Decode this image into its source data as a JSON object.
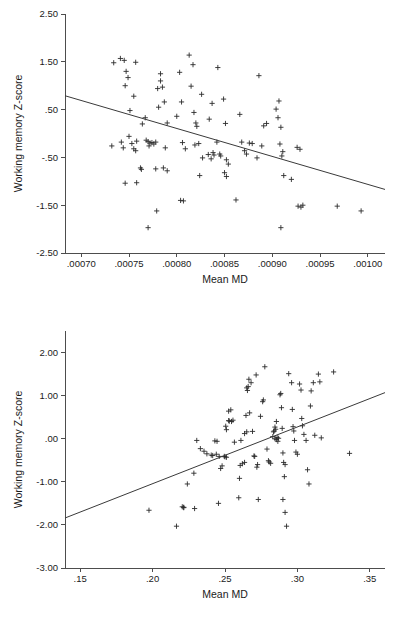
{
  "figure": {
    "title": "",
    "background": "#ffffff",
    "marker_color": "#2b2b2b",
    "axis_color": "#4d4d4d",
    "line_color": "#3a3a3a"
  },
  "chart_data": [
    {
      "id": "top",
      "type": "scatter",
      "title": "",
      "xlabel": "Mean MD",
      "ylabel": "Working memory Z-score",
      "xlim": [
        0.000683,
        0.001018
      ],
      "ylim": [
        -2.5,
        2.5
      ],
      "xticks": [
        0.0007,
        0.00075,
        0.0008,
        0.00085,
        0.0009,
        0.00095,
        0.001
      ],
      "xticklabels": [
        ".00070",
        ".00075",
        ".00080",
        ".00085",
        ".00090",
        ".00095",
        ".00100"
      ],
      "yticks": [
        2.5,
        1.5,
        0.5,
        -0.5,
        -1.5,
        -2.5
      ],
      "yticklabels": [
        "2.50",
        "1.50",
        ".50",
        "-.50",
        "-1.50",
        "-2.50"
      ],
      "grid": false,
      "legend": "none",
      "marker": "plus",
      "fit_line": {
        "x": [
          0.000683,
          0.001018
        ],
        "y": [
          0.79,
          -1.17
        ]
      },
      "points": [
        {
          "x": 0.000734,
          "y": 1.48
        },
        {
          "x": 0.000741,
          "y": 1.57
        },
        {
          "x": 0.000745,
          "y": 1.53
        },
        {
          "x": 0.000757,
          "y": 1.49
        },
        {
          "x": 0.000747,
          "y": 1.3
        },
        {
          "x": 0.000749,
          "y": 1.17
        },
        {
          "x": 0.000751,
          "y": 0.48
        },
        {
          "x": 0.000755,
          "y": 0.78
        },
        {
          "x": 0.000746,
          "y": 1.0
        },
        {
          "x": 0.000744,
          "y": -0.3
        },
        {
          "x": 0.000732,
          "y": -0.26
        },
        {
          "x": 0.000742,
          "y": -0.18
        },
        {
          "x": 0.000753,
          "y": -0.21
        },
        {
          "x": 0.000755,
          "y": -0.32
        },
        {
          "x": 0.00075,
          "y": -0.06
        },
        {
          "x": 0.000757,
          "y": -0.36
        },
        {
          "x": 0.000758,
          "y": -0.16
        },
        {
          "x": 0.000762,
          "y": -0.72
        },
        {
          "x": 0.000763,
          "y": -0.75
        },
        {
          "x": 0.000758,
          "y": -1.03
        },
        {
          "x": 0.000746,
          "y": -1.04
        },
        {
          "x": 0.000767,
          "y": 0.33
        },
        {
          "x": 0.000768,
          "y": -0.14
        },
        {
          "x": 0.00077,
          "y": -0.17
        },
        {
          "x": 0.000772,
          "y": -0.2
        },
        {
          "x": 0.000774,
          "y": -0.19
        },
        {
          "x": 0.000776,
          "y": -0.22
        },
        {
          "x": 0.000778,
          "y": -0.18
        },
        {
          "x": 0.000771,
          "y": -0.26
        },
        {
          "x": 0.000764,
          "y": 0.2
        },
        {
          "x": 0.000783,
          "y": 1.1
        },
        {
          "x": 0.000783,
          "y": 1.25
        },
        {
          "x": 0.00078,
          "y": 0.94
        },
        {
          "x": 0.000781,
          "y": 0.55
        },
        {
          "x": 0.000785,
          "y": 0.97
        },
        {
          "x": 0.000787,
          "y": 0.66
        },
        {
          "x": 0.00079,
          "y": 0.22
        },
        {
          "x": 0.000788,
          "y": -0.3
        },
        {
          "x": 0.000786,
          "y": -0.72
        },
        {
          "x": 0.00079,
          "y": -0.78
        },
        {
          "x": 0.000778,
          "y": -0.74
        },
        {
          "x": 0.00077,
          "y": -1.97
        },
        {
          "x": 0.000779,
          "y": -1.62
        },
        {
          "x": 0.000803,
          "y": 1.28
        },
        {
          "x": 0.000805,
          "y": 0.66
        },
        {
          "x": 0.0008,
          "y": 0.36
        },
        {
          "x": 0.000806,
          "y": -0.19
        },
        {
          "x": 0.000809,
          "y": -0.32
        },
        {
          "x": 0.000804,
          "y": -1.4
        },
        {
          "x": 0.000807,
          "y": -1.41
        },
        {
          "x": 0.000813,
          "y": 1.64
        },
        {
          "x": 0.000817,
          "y": 1.44
        },
        {
          "x": 0.000815,
          "y": 0.99
        },
        {
          "x": 0.000818,
          "y": 0.44
        },
        {
          "x": 0.00082,
          "y": 0.22
        },
        {
          "x": 0.000821,
          "y": 0.15
        },
        {
          "x": 0.000823,
          "y": -0.21
        },
        {
          "x": 0.000819,
          "y": -0.24
        },
        {
          "x": 0.000826,
          "y": 0.82
        },
        {
          "x": 0.000827,
          "y": -0.51
        },
        {
          "x": 0.000824,
          "y": -0.88
        },
        {
          "x": 0.000833,
          "y": -0.44
        },
        {
          "x": 0.000836,
          "y": -0.53
        },
        {
          "x": 0.000838,
          "y": -0.4
        },
        {
          "x": 0.000839,
          "y": -0.45
        },
        {
          "x": 0.000834,
          "y": 0.3
        },
        {
          "x": 0.000837,
          "y": 0.63
        },
        {
          "x": 0.000842,
          "y": -0.18
        },
        {
          "x": 0.000845,
          "y": -0.43
        },
        {
          "x": 0.000846,
          "y": -0.47
        },
        {
          "x": 0.000849,
          "y": 0.72
        },
        {
          "x": 0.000851,
          "y": 0.21
        },
        {
          "x": 0.000852,
          "y": -0.55
        },
        {
          "x": 0.00085,
          "y": -0.82
        },
        {
          "x": 0.000852,
          "y": -0.9
        },
        {
          "x": 0.000854,
          "y": -0.64
        },
        {
          "x": 0.000843,
          "y": 1.38
        },
        {
          "x": 0.000862,
          "y": -1.39
        },
        {
          "x": 0.000866,
          "y": 0.4
        },
        {
          "x": 0.000868,
          "y": -0.18
        },
        {
          "x": 0.000871,
          "y": -0.36
        },
        {
          "x": 0.000873,
          "y": -0.43
        },
        {
          "x": 0.000876,
          "y": -0.2
        },
        {
          "x": 0.000879,
          "y": -0.21
        },
        {
          "x": 0.000884,
          "y": -0.51
        },
        {
          "x": 0.000886,
          "y": 1.21
        },
        {
          "x": 0.000889,
          "y": -0.26
        },
        {
          "x": 0.000891,
          "y": 0.16
        },
        {
          "x": 0.000894,
          "y": 0.21
        },
        {
          "x": 0.000904,
          "y": 0.51
        },
        {
          "x": 0.000907,
          "y": 0.68
        },
        {
          "x": 0.000906,
          "y": 0.33
        },
        {
          "x": 0.000909,
          "y": 0.13
        },
        {
          "x": 0.000908,
          "y": -0.22
        },
        {
          "x": 0.000911,
          "y": -0.38
        },
        {
          "x": 0.00091,
          "y": -0.47
        },
        {
          "x": 0.000912,
          "y": -0.88
        },
        {
          "x": 0.000909,
          "y": -1.97
        },
        {
          "x": 0.00092,
          "y": -0.96
        },
        {
          "x": 0.000926,
          "y": -0.29
        },
        {
          "x": 0.000929,
          "y": -0.33
        },
        {
          "x": 0.000927,
          "y": -1.52
        },
        {
          "x": 0.00093,
          "y": -1.54
        },
        {
          "x": 0.000932,
          "y": -1.5
        },
        {
          "x": 0.000968,
          "y": -1.52
        },
        {
          "x": 0.000993,
          "y": -1.62
        }
      ]
    },
    {
      "id": "bottom",
      "type": "scatter",
      "title": "",
      "xlabel": "Mean MD",
      "ylabel": "Working memory Z-score",
      "xlim": [
        0.1395,
        0.3605
      ],
      "ylim": [
        -3.0,
        2.5
      ],
      "xticks": [
        0.15,
        0.2,
        0.25,
        0.3,
        0.35
      ],
      "xticklabels": [
        ".15",
        ".20",
        ".25",
        ".30",
        ".35"
      ],
      "yticks": [
        2.0,
        1.0,
        0.0,
        -1.0,
        -2.0,
        -3.0
      ],
      "yticklabels": [
        "2.00",
        "1.00",
        ".00",
        "-1.00",
        "-2.00",
        "-3.00"
      ],
      "grid": false,
      "legend": "none",
      "marker": "plus",
      "fit_line": {
        "x": [
          0.1395,
          0.3605
        ],
        "y": [
          -1.84,
          1.07
        ]
      },
      "points": [
        {
          "x": 0.1975,
          "y": -1.66
        },
        {
          "x": 0.2165,
          "y": -2.03
        },
        {
          "x": 0.2205,
          "y": -1.58
        },
        {
          "x": 0.2215,
          "y": -1.59
        },
        {
          "x": 0.2215,
          "y": -1.6
        },
        {
          "x": 0.224,
          "y": -1.05
        },
        {
          "x": 0.2285,
          "y": -0.8
        },
        {
          "x": 0.229,
          "y": -1.62
        },
        {
          "x": 0.2305,
          "y": -0.04
        },
        {
          "x": 0.233,
          "y": -0.23
        },
        {
          "x": 0.2355,
          "y": -0.29
        },
        {
          "x": 0.2375,
          "y": -0.35
        },
        {
          "x": 0.2405,
          "y": -0.38
        },
        {
          "x": 0.2415,
          "y": -0.39
        },
        {
          "x": 0.244,
          "y": -0.36
        },
        {
          "x": 0.243,
          "y": -0.05
        },
        {
          "x": 0.2445,
          "y": -0.06
        },
        {
          "x": 0.246,
          "y": -0.41
        },
        {
          "x": 0.247,
          "y": -0.69
        },
        {
          "x": 0.248,
          "y": -0.63
        },
        {
          "x": 0.2495,
          "y": -0.41
        },
        {
          "x": 0.25,
          "y": -0.42
        },
        {
          "x": 0.251,
          "y": -0.43
        },
        {
          "x": 0.2455,
          "y": -1.5
        },
        {
          "x": 0.2505,
          "y": 0.29
        },
        {
          "x": 0.251,
          "y": 0.21
        },
        {
          "x": 0.2525,
          "y": 0.42
        },
        {
          "x": 0.253,
          "y": 0.41
        },
        {
          "x": 0.2545,
          "y": 0.4
        },
        {
          "x": 0.2555,
          "y": 0.43
        },
        {
          "x": 0.2525,
          "y": 0.64
        },
        {
          "x": 0.254,
          "y": 0.67
        },
        {
          "x": 0.2565,
          "y": -0.08
        },
        {
          "x": 0.2595,
          "y": -1.37
        },
        {
          "x": 0.26,
          "y": -0.92
        },
        {
          "x": 0.2605,
          "y": -0.62
        },
        {
          "x": 0.262,
          "y": -0.58
        },
        {
          "x": 0.2635,
          "y": -0.55
        },
        {
          "x": 0.261,
          "y": -0.04
        },
        {
          "x": 0.2635,
          "y": 0.12
        },
        {
          "x": 0.265,
          "y": 0.16
        },
        {
          "x": 0.2645,
          "y": 0.54
        },
        {
          "x": 0.2655,
          "y": 1.12
        },
        {
          "x": 0.265,
          "y": 1.18
        },
        {
          "x": 0.266,
          "y": 1.21
        },
        {
          "x": 0.2665,
          "y": 1.38
        },
        {
          "x": 0.268,
          "y": 1.3
        },
        {
          "x": 0.267,
          "y": 0.6
        },
        {
          "x": 0.269,
          "y": 0.17
        },
        {
          "x": 0.27,
          "y": -0.4
        },
        {
          "x": 0.2705,
          "y": -0.41
        },
        {
          "x": 0.272,
          "y": -0.66
        },
        {
          "x": 0.2725,
          "y": -0.6
        },
        {
          "x": 0.273,
          "y": -1.41
        },
        {
          "x": 0.2715,
          "y": 1.48
        },
        {
          "x": 0.2745,
          "y": 0.52
        },
        {
          "x": 0.276,
          "y": 0.86
        },
        {
          "x": 0.2765,
          "y": 0.9
        },
        {
          "x": 0.2775,
          "y": 1.67
        },
        {
          "x": 0.279,
          "y": -0.24
        },
        {
          "x": 0.28,
          "y": -0.51
        },
        {
          "x": 0.2805,
          "y": -0.54
        },
        {
          "x": 0.2815,
          "y": -0.57
        },
        {
          "x": 0.283,
          "y": 0.05
        },
        {
          "x": 0.2835,
          "y": 0.16
        },
        {
          "x": 0.284,
          "y": 0.18
        },
        {
          "x": 0.2845,
          "y": 0.27
        },
        {
          "x": 0.285,
          "y": 0.22
        },
        {
          "x": 0.2845,
          "y": 0.0
        },
        {
          "x": 0.2855,
          "y": -0.02
        },
        {
          "x": 0.286,
          "y": 0.03
        },
        {
          "x": 0.2865,
          "y": -0.06
        },
        {
          "x": 0.287,
          "y": 0.01
        },
        {
          "x": 0.2855,
          "y": 0.4
        },
        {
          "x": 0.288,
          "y": 1.02
        },
        {
          "x": 0.2885,
          "y": 1.05
        },
        {
          "x": 0.289,
          "y": 0.72
        },
        {
          "x": 0.2895,
          "y": 0.24
        },
        {
          "x": 0.29,
          "y": -0.33
        },
        {
          "x": 0.2905,
          "y": -0.55
        },
        {
          "x": 0.2915,
          "y": -0.6
        },
        {
          "x": 0.291,
          "y": -0.88
        },
        {
          "x": 0.29,
          "y": -1.41
        },
        {
          "x": 0.2915,
          "y": -1.71
        },
        {
          "x": 0.2925,
          "y": -2.03
        },
        {
          "x": 0.294,
          "y": 1.51
        },
        {
          "x": 0.296,
          "y": 1.3
        },
        {
          "x": 0.2965,
          "y": 0.68
        },
        {
          "x": 0.297,
          "y": 0.28
        },
        {
          "x": 0.2975,
          "y": 0.18
        },
        {
          "x": 0.298,
          "y": -0.04
        },
        {
          "x": 0.299,
          "y": -0.31
        },
        {
          "x": 0.3,
          "y": -0.36
        },
        {
          "x": 0.3015,
          "y": 1.27
        },
        {
          "x": 0.3025,
          "y": 1.13
        },
        {
          "x": 0.303,
          "y": 0.47
        },
        {
          "x": 0.3035,
          "y": 0.3
        },
        {
          "x": 0.3045,
          "y": 0.1
        },
        {
          "x": 0.306,
          "y": -0.04
        },
        {
          "x": 0.307,
          "y": -0.72
        },
        {
          "x": 0.308,
          "y": -1.05
        },
        {
          "x": 0.309,
          "y": 0.76
        },
        {
          "x": 0.3095,
          "y": 1.11
        },
        {
          "x": 0.311,
          "y": 1.3
        },
        {
          "x": 0.312,
          "y": 0.08
        },
        {
          "x": 0.3145,
          "y": 1.5
        },
        {
          "x": 0.3155,
          "y": 1.32
        },
        {
          "x": 0.3165,
          "y": 0.02
        },
        {
          "x": 0.325,
          "y": 1.55
        },
        {
          "x": 0.336,
          "y": -0.34
        }
      ]
    }
  ]
}
